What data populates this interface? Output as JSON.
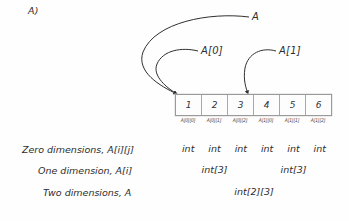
{
  "figure": {
    "section_marker": "A)",
    "background_color": "#fefefe",
    "ink_color": "#2f2f2f"
  },
  "pointers": [
    {
      "id": "A",
      "label": "A",
      "target_cell_index": 0
    },
    {
      "id": "A0",
      "label": "A[0]",
      "target_cell_index": 0
    },
    {
      "id": "A1",
      "label": "A[1]",
      "target_cell_index": 3
    }
  ],
  "array": {
    "cells": [
      "1",
      "2",
      "3",
      "4",
      "5",
      "6"
    ],
    "index_labels": [
      "A[0][0]",
      "A[0][1]",
      "A[0][2]",
      "A[1][0]",
      "A[1][1]",
      "A[1][2]"
    ]
  },
  "rows": {
    "zero": {
      "description": "Zero dimensions, A[i][j]",
      "types": [
        "int",
        "int",
        "int",
        "int",
        "int",
        "int"
      ]
    },
    "one": {
      "description": "One dimension, A[i]",
      "types": [
        "int[3]",
        "int[3]"
      ]
    },
    "two": {
      "description": "Two dimensions, A",
      "types": [
        "int[2][3]"
      ]
    }
  }
}
